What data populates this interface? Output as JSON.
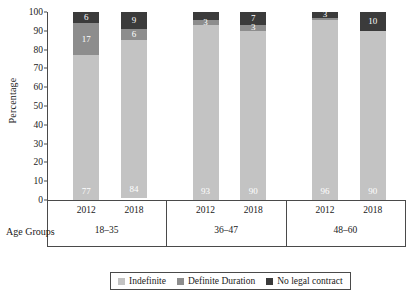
{
  "chart_data": {
    "type": "bar",
    "subtype": "stacked-column-100",
    "title": "",
    "xlabel": "Age Groups",
    "ylabel": "Percentage",
    "ylim": [
      0,
      100
    ],
    "yticks": [
      0,
      10,
      20,
      30,
      40,
      50,
      60,
      70,
      80,
      90,
      100
    ],
    "grid": false,
    "legend_position": "bottom",
    "groups": [
      "18–35",
      "36–47",
      "48–60"
    ],
    "categories": [
      "2012",
      "2018",
      "2012",
      "2018",
      "2012",
      "2018"
    ],
    "series": [
      {
        "name": "Indefinite",
        "color": "#c3c3c3",
        "values": [
          77,
          84,
          93,
          90,
          96,
          90
        ]
      },
      {
        "name": "Definite Duration",
        "color": "#8d8d8d",
        "values": [
          17,
          6,
          3,
          3,
          1,
          0
        ]
      },
      {
        "name": "No legal contract",
        "color": "#3b3b3b",
        "values": [
          6,
          9,
          4,
          7,
          3,
          10
        ]
      }
    ],
    "bar_labels": [
      {
        "group": "18–35",
        "year": "2012",
        "indefinite": "77",
        "definite": "17",
        "nolegal": "6"
      },
      {
        "group": "18–35",
        "year": "2018",
        "indefinite": "84",
        "definite": "6",
        "nolegal": "9"
      },
      {
        "group": "36–47",
        "year": "2012",
        "indefinite": "93",
        "definite": "3",
        "nolegal": ""
      },
      {
        "group": "36–47",
        "year": "2018",
        "indefinite": "90",
        "definite": "3",
        "nolegal": "7"
      },
      {
        "group": "48–60",
        "year": "2012",
        "indefinite": "96",
        "definite": "",
        "nolegal": "3"
      },
      {
        "group": "48–60",
        "year": "2018",
        "indefinite": "90",
        "definite": "",
        "nolegal": "10"
      }
    ]
  },
  "axis": {
    "y_title": "Percentage",
    "x_title": "Age Groups",
    "y_tick_labels": [
      "100",
      "90",
      "80",
      "70",
      "60",
      "50",
      "40",
      "30",
      "20",
      "10",
      "0"
    ]
  },
  "groups": [
    {
      "label": "18–35",
      "years": [
        "2012",
        "2018"
      ]
    },
    {
      "label": "36–47",
      "years": [
        "2012",
        "2018"
      ]
    },
    {
      "label": "48–60",
      "years": [
        "2012",
        "2018"
      ]
    }
  ],
  "legend": {
    "items": [
      {
        "label": "Indefinite",
        "color": "#c3c3c3"
      },
      {
        "label": "Definite Duration",
        "color": "#8d8d8d"
      },
      {
        "label": "No legal contract",
        "color": "#3b3b3b"
      }
    ]
  },
  "colors": {
    "indefinite": "#c3c3c3",
    "definite": "#8d8d8d",
    "nolegal": "#3b3b3b",
    "axis": "#4a4a4a",
    "text": "#1a1a1a",
    "background": "#ffffff"
  }
}
